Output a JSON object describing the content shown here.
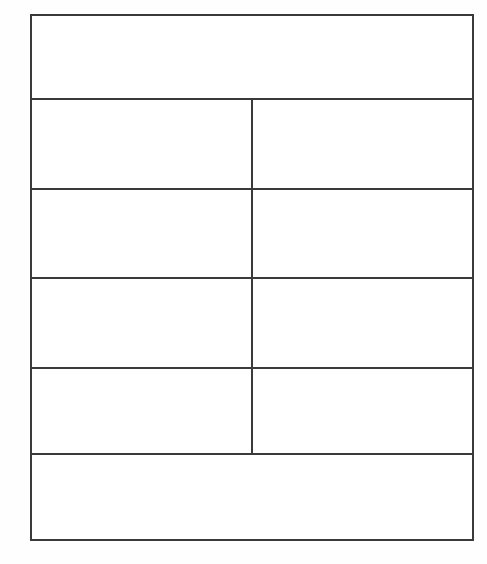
{
  "document": {
    "title": "",
    "background_color": "#fefefe",
    "page_width": 487,
    "page_height": 564
  },
  "table": {
    "border_color": "#3a3a3a",
    "cell_background": "#ffffff",
    "border_width_px": 2,
    "column_count": 2,
    "row_count": 6,
    "header": {
      "label": "",
      "colspan": 2
    },
    "rows": [
      {
        "left": "",
        "right": ""
      },
      {
        "left": "",
        "right": ""
      },
      {
        "left": "",
        "right": ""
      },
      {
        "left": "",
        "right": ""
      }
    ],
    "footer": {
      "label": "",
      "colspan": 2
    }
  }
}
